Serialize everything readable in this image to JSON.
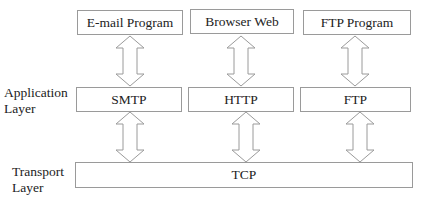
{
  "diagram": {
    "layer_labels": {
      "application": [
        "Application",
        "Layer"
      ],
      "transport": [
        "Transport",
        "Layer"
      ]
    },
    "programs": [
      {
        "label": "E-mail Program"
      },
      {
        "label": "Browser Web"
      },
      {
        "label": "FTP Program"
      }
    ],
    "application_protocols": [
      {
        "label": "SMTP"
      },
      {
        "label": "HTTP"
      },
      {
        "label": "FTP"
      }
    ],
    "transport_protocol": {
      "label": "TCP"
    },
    "colors": {
      "stroke": "#9a9a9a",
      "text": "#222222",
      "background": "#ffffff"
    }
  }
}
